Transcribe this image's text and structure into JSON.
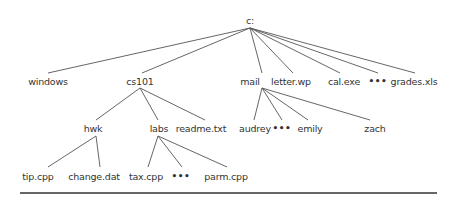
{
  "diagram": {
    "title": "",
    "colors": {
      "text": "#333333",
      "edge": "#555555",
      "rule": "#666666",
      "background": "#ffffff"
    },
    "nodes": [
      {
        "id": "root",
        "label": "c:",
        "x": 250,
        "y": 20,
        "edge_y": 27,
        "parent": null
      },
      {
        "id": "windows",
        "label": "windows",
        "x": 48,
        "y": 81,
        "edge_y": 73,
        "parent": "root",
        "edge_x": 48
      },
      {
        "id": "cs101",
        "label": "cs101",
        "x": 140,
        "y": 81,
        "edge_y": 73,
        "parent": "root",
        "edge_x": 142
      },
      {
        "id": "mail",
        "label": "mail",
        "x": 250,
        "y": 81,
        "edge_y": 73,
        "parent": "root",
        "edge_x": 262
      },
      {
        "id": "letter_wp",
        "label": "letter.wp",
        "x": 291,
        "y": 81,
        "edge_y": 73,
        "parent": "root",
        "edge_x": 293
      },
      {
        "id": "cal_exe",
        "label": "cal.exe",
        "x": 344,
        "y": 81,
        "edge_y": 73,
        "parent": "root",
        "edge_x": 340
      },
      {
        "id": "root_more",
        "label": "•••",
        "x": 378,
        "y": 81,
        "edge_y": 73,
        "parent": "root",
        "edge_x": 378,
        "ellipsis": true
      },
      {
        "id": "grades_xls",
        "label": "grades.xls",
        "x": 414,
        "y": 81,
        "edge_y": 73,
        "parent": "root",
        "edge_x": 415
      },
      {
        "id": "hwk",
        "label": "hwk",
        "x": 93,
        "y": 128,
        "edge_y": 120,
        "parent": "cs101",
        "edge_x": 96
      },
      {
        "id": "labs",
        "label": "labs",
        "x": 159,
        "y": 128,
        "edge_y": 120,
        "parent": "cs101",
        "edge_x": 158
      },
      {
        "id": "readme_txt",
        "label": "readme.txt",
        "x": 201,
        "y": 128,
        "edge_y": 120,
        "parent": "cs101",
        "edge_x": 205
      },
      {
        "id": "audrey",
        "label": "audrey",
        "x": 255,
        "y": 128,
        "edge_y": 120,
        "parent": "mail",
        "edge_x": 254
      },
      {
        "id": "mail_more",
        "label": "•••",
        "x": 282,
        "y": 128,
        "edge_y": 120,
        "parent": "mail",
        "edge_x": 282,
        "ellipsis": true
      },
      {
        "id": "emily",
        "label": "emily",
        "x": 310,
        "y": 128,
        "edge_y": 120,
        "parent": "mail",
        "edge_x": 308
      },
      {
        "id": "zach",
        "label": "zach",
        "x": 375,
        "y": 128,
        "edge_y": 120,
        "parent": "mail",
        "edge_x": 370
      },
      {
        "id": "tip_cpp",
        "label": "tip.cpp",
        "x": 38,
        "y": 176,
        "edge_y": 167,
        "parent": "hwk",
        "edge_x": 48
      },
      {
        "id": "change_dat",
        "label": "change.dat",
        "x": 94,
        "y": 176,
        "edge_y": 167,
        "parent": "hwk",
        "edge_x": 100
      },
      {
        "id": "tax_cpp",
        "label": "tax.cpp",
        "x": 146,
        "y": 176,
        "edge_y": 167,
        "parent": "labs",
        "edge_x": 148
      },
      {
        "id": "labs_more",
        "label": "•••",
        "x": 181,
        "y": 176,
        "edge_y": 167,
        "parent": "labs",
        "edge_x": 182,
        "ellipsis": true
      },
      {
        "id": "parm_cpp",
        "label": "parm.cpp",
        "x": 226,
        "y": 176,
        "edge_y": 167,
        "parent": "labs",
        "edge_x": 227
      }
    ],
    "parent_anchor": {
      "root": {
        "x": 250,
        "y": 28
      },
      "cs101": {
        "x": 140,
        "y": 88
      },
      "mail": {
        "x": 262,
        "y": 88
      },
      "hwk": {
        "x": 96,
        "y": 136
      },
      "labs": {
        "x": 158,
        "y": 136
      }
    },
    "rule": {
      "x1": 20,
      "x2": 437,
      "y": 192
    }
  }
}
